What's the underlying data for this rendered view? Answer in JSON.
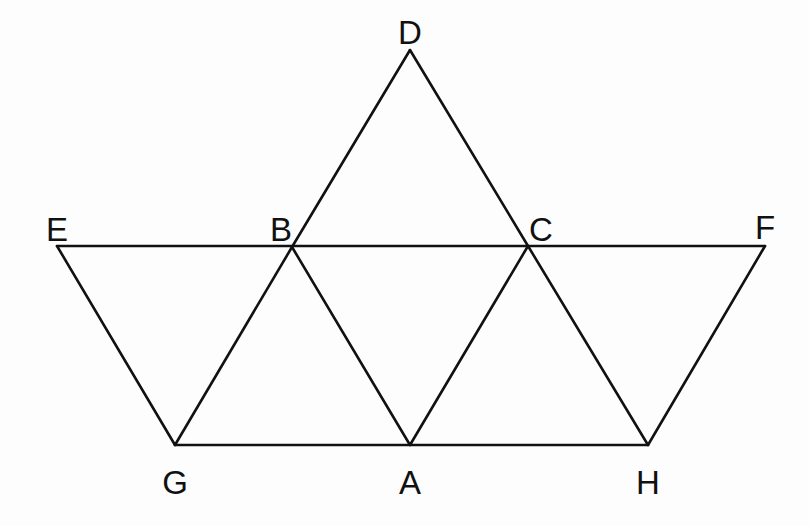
{
  "diagram": {
    "type": "geometric-figure",
    "stroke_color": "#111111",
    "background": "#fdfdfd",
    "points": {
      "D": {
        "x": 410,
        "y": 50
      },
      "E": {
        "x": 57,
        "y": 246
      },
      "B": {
        "x": 292,
        "y": 247
      },
      "C": {
        "x": 528,
        "y": 246
      },
      "F": {
        "x": 765,
        "y": 246
      },
      "G": {
        "x": 175,
        "y": 445
      },
      "A": {
        "x": 410,
        "y": 445
      },
      "H": {
        "x": 648,
        "y": 445
      }
    },
    "edges": [
      [
        "D",
        "B"
      ],
      [
        "D",
        "C"
      ],
      [
        "E",
        "F"
      ],
      [
        "E",
        "G"
      ],
      [
        "B",
        "G"
      ],
      [
        "B",
        "A"
      ],
      [
        "C",
        "A"
      ],
      [
        "C",
        "H"
      ],
      [
        "F",
        "H"
      ],
      [
        "G",
        "H"
      ]
    ],
    "labels": [
      {
        "id": "D",
        "text": "D",
        "x": 410,
        "y": 16
      },
      {
        "id": "E",
        "text": "E",
        "x": 57,
        "y": 213
      },
      {
        "id": "B",
        "text": "B",
        "x": 281,
        "y": 213
      },
      {
        "id": "C",
        "text": "C",
        "x": 541,
        "y": 213
      },
      {
        "id": "F",
        "text": "F",
        "x": 765,
        "y": 211
      },
      {
        "id": "G",
        "text": "G",
        "x": 175,
        "y": 466
      },
      {
        "id": "A",
        "text": "A",
        "x": 410,
        "y": 466
      },
      {
        "id": "H",
        "text": "H",
        "x": 648,
        "y": 466
      }
    ]
  }
}
